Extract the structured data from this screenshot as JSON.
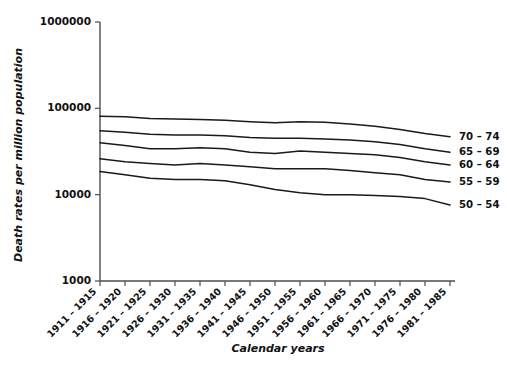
{
  "chart_data": {
    "type": "line",
    "title": "",
    "xlabel": "Calendar years",
    "ylabel": "Death rates per million population",
    "yscale": "log",
    "ylim": [
      1000,
      1000000
    ],
    "ytick_labels": [
      "1000000",
      "100000",
      "10000",
      "1000"
    ],
    "ytick_values": [
      1000000,
      100000,
      10000,
      1000
    ],
    "grid": false,
    "legend_position": "right-inline-labels",
    "categories": [
      "1911 – 1915",
      "1916 – 1920",
      "1921 – 1925",
      "1926 – 1930",
      "1931 – 1935",
      "1936 – 1940",
      "1941 – 1945",
      "1946 – 1950",
      "1951 – 1955",
      "1956 – 1960",
      "1961 – 1965",
      "1966 – 1970",
      "1971 – 1975",
      "1976 – 1980",
      "1981 – 1985"
    ],
    "series": [
      {
        "name": "70 – 74",
        "label": "70 – 74",
        "values": [
          81000,
          80000,
          76000,
          75000,
          74000,
          73000,
          70000,
          68000,
          70000,
          69000,
          66000,
          62000,
          57000,
          51000,
          47000
        ]
      },
      {
        "name": "65 – 69",
        "label": "65 – 69",
        "values": [
          55000,
          53000,
          50000,
          49000,
          49000,
          48000,
          46000,
          45000,
          45000,
          44000,
          43000,
          41000,
          38000,
          34000,
          31000
        ]
      },
      {
        "name": "60 – 64",
        "label": "60 – 64",
        "values": [
          40000,
          37000,
          34000,
          34000,
          35000,
          34000,
          31000,
          30000,
          32000,
          31000,
          30000,
          29000,
          27000,
          24000,
          22000
        ]
      },
      {
        "name": "55 – 59",
        "label": "55 – 59",
        "values": [
          26000,
          24000,
          23000,
          22000,
          23000,
          22000,
          21000,
          20000,
          20000,
          20000,
          19000,
          18000,
          17000,
          15000,
          14000
        ]
      },
      {
        "name": "50 – 54",
        "label": "50 – 54",
        "values": [
          18500,
          17000,
          15500,
          15000,
          15000,
          14500,
          13000,
          11500,
          10500,
          10000,
          10000,
          9800,
          9500,
          9000,
          7600
        ]
      }
    ]
  }
}
